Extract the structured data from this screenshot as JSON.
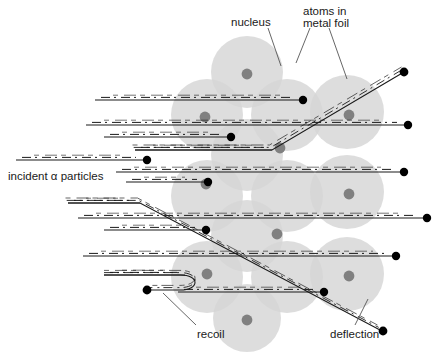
{
  "figure": {
    "title_alt": "Rutherford scattering of alpha particles by atoms in a metal foil",
    "background_color": "#ffffff",
    "atom_fill_color": "#d6d6d6",
    "nucleus_fill_color": "#808080",
    "track_color": "#1a1a1a",
    "particle_dot_color": "#000000",
    "leader_line_color": "#555555"
  },
  "labels": {
    "nucleus": "nucleus",
    "atoms_in_metal_foil_line1": "atoms in",
    "atoms_in_metal_foil_line2": "metal foil",
    "incident": "incident  α particles",
    "recoil": "recoil",
    "deflection": "deflection"
  },
  "atoms": [
    {
      "cx": 247,
      "cy": 72,
      "r": 36,
      "nucleus": true,
      "nx": 247,
      "ny": 74
    },
    {
      "cx": 207,
      "cy": 115,
      "r": 36,
      "nucleus": true,
      "nx": 205,
      "ny": 117
    },
    {
      "cx": 287,
      "cy": 115,
      "r": 36,
      "nucleus": false,
      "nx": 0,
      "ny": 0
    },
    {
      "cx": 347,
      "cy": 112,
      "r": 37,
      "nucleus": true,
      "nx": 349,
      "ny": 115
    },
    {
      "cx": 247,
      "cy": 155,
      "r": 36,
      "nucleus": true,
      "nx": 280,
      "ny": 148
    },
    {
      "cx": 207,
      "cy": 196,
      "r": 36,
      "nucleus": true,
      "nx": 206,
      "ny": 184
    },
    {
      "cx": 287,
      "cy": 196,
      "r": 36,
      "nucleus": false,
      "nx": 0,
      "ny": 0
    },
    {
      "cx": 347,
      "cy": 192,
      "r": 37,
      "nucleus": true,
      "nx": 349,
      "ny": 194
    },
    {
      "cx": 247,
      "cy": 236,
      "r": 36,
      "nucleus": true,
      "nx": 277,
      "ny": 234
    },
    {
      "cx": 207,
      "cy": 277,
      "r": 36,
      "nucleus": true,
      "nx": 207,
      "ny": 274
    },
    {
      "cx": 287,
      "cy": 277,
      "r": 36,
      "nucleus": false,
      "nx": 0,
      "ny": 0
    },
    {
      "cx": 347,
      "cy": 274,
      "r": 37,
      "nucleus": true,
      "nx": 349,
      "ny": 276
    },
    {
      "cx": 247,
      "cy": 318,
      "r": 34,
      "nucleus": true,
      "nx": 247,
      "ny": 320
    }
  ],
  "tracks": [
    {
      "name": "track-1",
      "x1": 95,
      "y": 100,
      "x2": 300,
      "dot_x": 303,
      "dot": true
    },
    {
      "name": "track-2",
      "x1": 86,
      "y": 125,
      "x2": 404,
      "dot_x": 408,
      "dot": true
    },
    {
      "name": "track-3",
      "x1": 104,
      "y": 137,
      "x2": 228,
      "dot_x": 231,
      "dot": true
    },
    {
      "name": "track-4",
      "x1": 135,
      "y": 150,
      "x2": 272,
      "dot_x": 0,
      "dot": false
    },
    {
      "name": "track-5",
      "x1": 16,
      "y": 160,
      "x2": 143,
      "dot_x": 147,
      "dot": true
    },
    {
      "name": "track-6",
      "x1": 116,
      "y": 172,
      "x2": 400,
      "dot_x": 404,
      "dot": true
    },
    {
      "name": "track-7",
      "x1": 126,
      "y": 182,
      "x2": 205,
      "dot_x": 208,
      "dot": true
    },
    {
      "name": "track-8",
      "x1": 68,
      "y": 203,
      "x2": 140,
      "dot_x": 0,
      "dot": false
    },
    {
      "name": "track-9",
      "x1": 78,
      "y": 218,
      "x2": 424,
      "dot_x": 427,
      "dot": true
    },
    {
      "name": "track-10",
      "x1": 104,
      "y": 230,
      "x2": 203,
      "dot_x": 206,
      "dot": true
    },
    {
      "name": "track-11",
      "x1": 83,
      "y": 256,
      "x2": 392,
      "dot_x": 396,
      "dot": true
    },
    {
      "name": "track-12",
      "x1": 104,
      "y": 275,
      "x2": 185,
      "dot_x": 0,
      "dot": false
    },
    {
      "name": "track-13",
      "x1": 178,
      "y": 292,
      "x2": 320,
      "dot_x": 324,
      "dot": true
    }
  ],
  "deflections": [
    {
      "name": "deflection-upper",
      "points": "135,150 272,150 404,72",
      "dot_x": 404,
      "dot_y": 72
    },
    {
      "name": "deflection-lower",
      "points": "68,203 140,203 380,330",
      "dot_x": 383,
      "dot_y": 331
    }
  ],
  "recoil": {
    "name": "recoil-path",
    "path": "M 104,275 L 180,275 C 200,275 200,290 180,290 L 150,290",
    "dot_x": 147,
    "dot_y": 290
  },
  "leaders": [
    {
      "name": "leader-nucleus",
      "x1": 268,
      "y1": 28,
      "x2": 281,
      "y2": 66
    },
    {
      "name": "leader-atoms-a",
      "x1": 310,
      "y1": 28,
      "x2": 296,
      "y2": 63
    },
    {
      "name": "leader-atoms-b",
      "x1": 329,
      "y1": 28,
      "x2": 347,
      "y2": 79
    },
    {
      "name": "leader-recoil",
      "x1": 196,
      "y1": 325,
      "x2": 163,
      "y2": 293
    },
    {
      "name": "leader-deflection",
      "x1": 355,
      "y1": 325,
      "x2": 368,
      "y2": 299
    }
  ],
  "label_positions": {
    "nucleus": {
      "x": 231,
      "y": 26,
      "anchor": "start"
    },
    "atoms_l1": {
      "x": 303,
      "y": 15,
      "anchor": "start"
    },
    "atoms_l2": {
      "x": 303,
      "y": 27,
      "anchor": "start"
    },
    "incident": {
      "x": 8,
      "y": 180,
      "anchor": "start"
    },
    "recoil": {
      "x": 197,
      "y": 338,
      "anchor": "start"
    },
    "deflection": {
      "x": 330,
      "y": 338,
      "anchor": "start"
    }
  }
}
